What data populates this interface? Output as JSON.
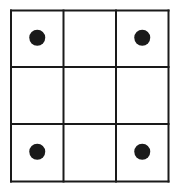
{
  "diagram": {
    "rows": 3,
    "cols": 3,
    "colors": {
      "line": "#1a1a1a",
      "dot": "#1a1a1a",
      "background": "#ffffff"
    },
    "dots": [
      {
        "row": 0,
        "col": 0
      },
      {
        "row": 0,
        "col": 2
      },
      {
        "row": 2,
        "col": 0
      },
      {
        "row": 2,
        "col": 2
      }
    ]
  }
}
